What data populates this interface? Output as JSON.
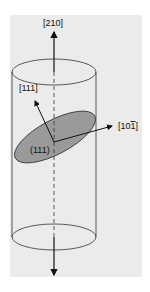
{
  "diagram": {
    "type": "crystal-orientation-cylinder",
    "colors": {
      "panel": "#ebebeb",
      "outline": "#333333",
      "plane_fill": "#9a9a9a",
      "arrow": "#111111"
    },
    "labels": {
      "axis_top": "[210]",
      "normal_vector": "[111]",
      "in_plane_vector": "[10",
      "in_plane_vector_bar_digit": "1",
      "in_plane_vector_close": "]",
      "plane": "(111)"
    }
  }
}
